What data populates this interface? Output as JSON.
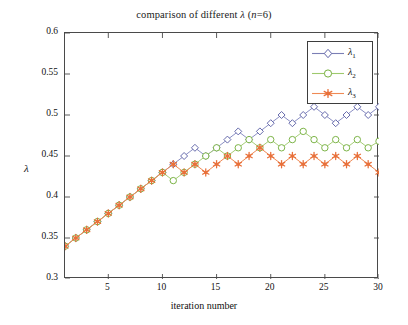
{
  "chart_data": {
    "type": "line",
    "title": "comparison of different λ (n=6)",
    "title_plain": "comparison of different lambda (n=6)",
    "xlabel": "iteration number",
    "ylabel": "λ",
    "xlim": [
      1,
      30
    ],
    "ylim": [
      0.3,
      0.6
    ],
    "xticks": [
      5,
      10,
      15,
      20,
      25,
      30
    ],
    "yticks": [
      0.3,
      0.35,
      0.4,
      0.45,
      0.5,
      0.55,
      0.6
    ],
    "ytick_labels": [
      "0.3",
      "0.35",
      "0.4",
      "0.45",
      "0.5",
      "0.55",
      "0.6"
    ],
    "xtick_labels": [
      "5",
      "10",
      "15",
      "20",
      "25",
      "30"
    ],
    "grid": false,
    "legend_position": "top-right",
    "x": [
      1,
      2,
      3,
      4,
      5,
      6,
      7,
      8,
      9,
      10,
      11,
      12,
      13,
      14,
      15,
      16,
      17,
      18,
      19,
      20,
      21,
      22,
      23,
      24,
      25,
      26,
      27,
      28,
      29,
      30
    ],
    "series": [
      {
        "name": "λ₁",
        "label": "lambda_1",
        "color": "#7b7fb5",
        "marker": "diamond-open",
        "values": [
          0.34,
          0.35,
          0.36,
          0.37,
          0.38,
          0.39,
          0.4,
          0.41,
          0.42,
          0.43,
          0.44,
          0.45,
          0.46,
          0.45,
          0.46,
          0.47,
          0.48,
          0.47,
          0.48,
          0.49,
          0.5,
          0.49,
          0.5,
          0.51,
          0.5,
          0.49,
          0.5,
          0.51,
          0.5,
          0.51
        ]
      },
      {
        "name": "λ₂",
        "label": "lambda_2",
        "color": "#8fbc5a",
        "marker": "circle-open",
        "values": [
          0.34,
          0.35,
          0.36,
          0.37,
          0.38,
          0.39,
          0.4,
          0.41,
          0.42,
          0.43,
          0.42,
          0.43,
          0.44,
          0.45,
          0.46,
          0.45,
          0.46,
          0.47,
          0.46,
          0.47,
          0.46,
          0.47,
          0.48,
          0.47,
          0.46,
          0.47,
          0.46,
          0.47,
          0.46,
          0.468
        ]
      },
      {
        "name": "λ₃",
        "label": "lambda_3",
        "color": "#e8703a",
        "marker": "star-filled",
        "values": [
          0.34,
          0.35,
          0.36,
          0.37,
          0.38,
          0.39,
          0.4,
          0.41,
          0.42,
          0.43,
          0.44,
          0.43,
          0.44,
          0.43,
          0.44,
          0.45,
          0.44,
          0.45,
          0.46,
          0.45,
          0.44,
          0.45,
          0.44,
          0.45,
          0.44,
          0.45,
          0.44,
          0.45,
          0.44,
          0.43
        ]
      }
    ]
  },
  "legend": {
    "entries": [
      {
        "text": "λ",
        "sub": "1"
      },
      {
        "text": "λ",
        "sub": "2"
      },
      {
        "text": "λ",
        "sub": "3"
      }
    ]
  },
  "axes": {
    "x_axis_label": "iteration number",
    "y_axis_label": "λ"
  }
}
